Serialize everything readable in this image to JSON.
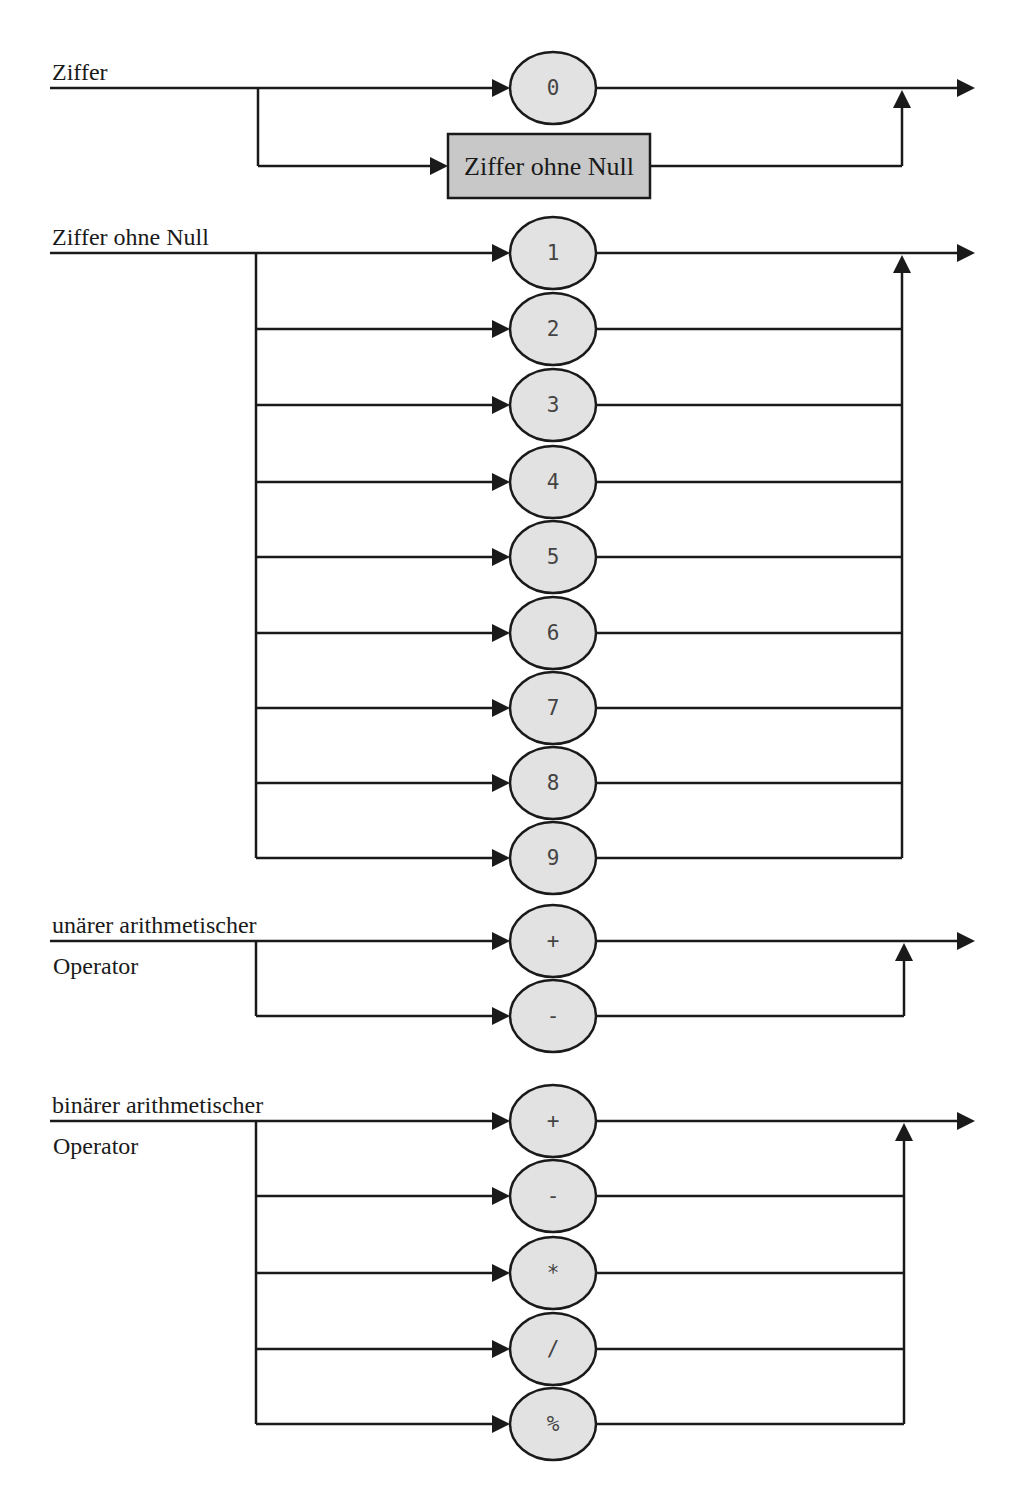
{
  "colors": {
    "line": "#1a1a1a",
    "terminal_fill": "#e2e2e2",
    "nonterminal_fill": "#c8c8c8",
    "background": "#ffffff"
  },
  "diagrams": [
    {
      "id": "ziffer",
      "label_lines": [
        "Ziffer"
      ],
      "main_y": 88,
      "branch_x": 258,
      "merge_x": 902,
      "alternatives": [
        {
          "kind": "terminal",
          "text": "0",
          "y": 88
        },
        {
          "kind": "nonterminal",
          "text": "Ziffer ohne Null",
          "y": 166
        }
      ]
    },
    {
      "id": "ziffer-ohne-null",
      "label_lines": [
        "Ziffer ohne Null"
      ],
      "main_y": 253,
      "branch_x": 256,
      "merge_x": 902,
      "alternatives": [
        {
          "kind": "terminal",
          "text": "1",
          "y": 253
        },
        {
          "kind": "terminal",
          "text": "2",
          "y": 329
        },
        {
          "kind": "terminal",
          "text": "3",
          "y": 405
        },
        {
          "kind": "terminal",
          "text": "4",
          "y": 482
        },
        {
          "kind": "terminal",
          "text": "5",
          "y": 557
        },
        {
          "kind": "terminal",
          "text": "6",
          "y": 633
        },
        {
          "kind": "terminal",
          "text": "7",
          "y": 708
        },
        {
          "kind": "terminal",
          "text": "8",
          "y": 783
        },
        {
          "kind": "terminal",
          "text": "9",
          "y": 858
        }
      ]
    },
    {
      "id": "unaerer-arithmetischer-operator",
      "label_lines": [
        "unärer arithmetischer",
        "Operator"
      ],
      "main_y": 941,
      "branch_x": 256,
      "merge_x": 904,
      "alternatives": [
        {
          "kind": "terminal",
          "text": "+",
          "y": 941
        },
        {
          "kind": "terminal",
          "text": "-",
          "y": 1016
        }
      ]
    },
    {
      "id": "binaerer-arithmetischer-operator",
      "label_lines": [
        "binärer arithmetischer",
        "Operator"
      ],
      "main_y": 1121,
      "branch_x": 256,
      "merge_x": 904,
      "alternatives": [
        {
          "kind": "terminal",
          "text": "+",
          "y": 1121
        },
        {
          "kind": "terminal",
          "text": "-",
          "y": 1196
        },
        {
          "kind": "terminal",
          "text": "*",
          "y": 1273
        },
        {
          "kind": "terminal",
          "text": "/",
          "y": 1349
        },
        {
          "kind": "terminal",
          "text": "%",
          "y": 1424
        }
      ]
    }
  ]
}
